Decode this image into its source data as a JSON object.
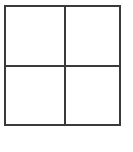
{
  "diagram": {
    "type": "2x2 grid",
    "rows": 2,
    "cols": 2,
    "line_color": "#3a3a3a",
    "background": "#ffffff",
    "cells": [
      {
        "row": 0,
        "col": 0,
        "label": ""
      },
      {
        "row": 0,
        "col": 1,
        "label": ""
      },
      {
        "row": 1,
        "col": 0,
        "label": ""
      },
      {
        "row": 1,
        "col": 1,
        "label": ""
      }
    ]
  }
}
